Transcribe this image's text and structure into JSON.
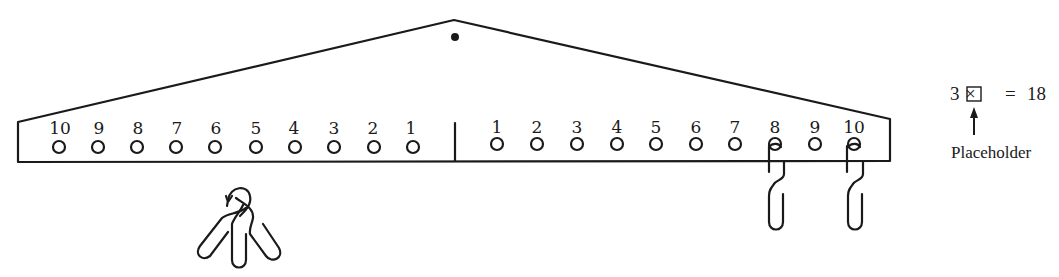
{
  "diagram": {
    "pivot": {
      "label": "pivot-dot"
    },
    "left_arm": {
      "labels": [
        "10",
        "9",
        "8",
        "7",
        "6",
        "5",
        "4",
        "3",
        "2",
        "1"
      ],
      "hook_group_label": "three hooks held together"
    },
    "right_arm": {
      "labels": [
        "1",
        "2",
        "3",
        "4",
        "5",
        "6",
        "7",
        "8",
        "9",
        "10"
      ],
      "hooks_at": [
        "8",
        "10"
      ]
    },
    "equation": {
      "lhs_factor": "3",
      "operator": "×",
      "placeholder_box": "□",
      "equals": "=",
      "rhs": "18",
      "arrow": "↑",
      "caption": "Placeholder"
    },
    "colors": {
      "ink": "#1a1a1a",
      "background": "#ffffff"
    }
  }
}
